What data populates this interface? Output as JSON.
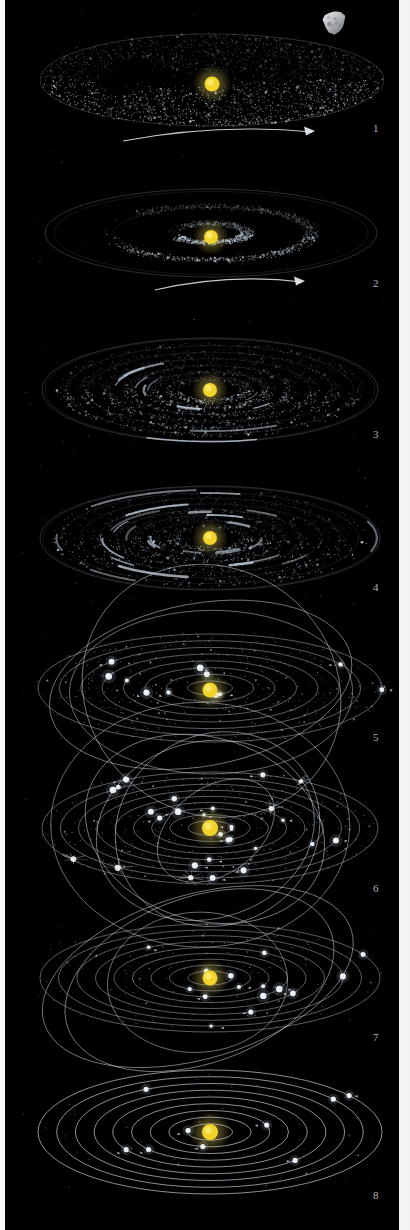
{
  "figure": {
    "background_color": "#000000",
    "border_color": "#f4f4f2",
    "star_color": "#f2d32a",
    "dust_color": "#c9d8e8",
    "orbit_color": "#cdd7e2",
    "width": 410,
    "height": 1230
  },
  "panels": [
    {
      "number": "1",
      "stage": "flattened-rotating-nebula",
      "caption": "Rotating cloud of gas and dust flattens into a disc",
      "top": 4,
      "height": 166,
      "sun_cx": 207,
      "sun_cy": 84,
      "sun_r": 7.5,
      "disc_rx": 172,
      "disc_ry": 46,
      "disc_cy": 80,
      "particle_count": 2600,
      "has_rotation_arrow": true,
      "arrow": {
        "x1": 118,
        "y1": 141,
        "x2": 307,
        "y2": 132,
        "label": "rotation-direction"
      },
      "has_asteroid": true,
      "asteroid": {
        "cx": 328,
        "cy": 22,
        "r": 13,
        "label": "asteroid-body"
      },
      "wedge_gap": true,
      "rings": 0
    },
    {
      "number": "2",
      "stage": "disc-breaking-into-bands",
      "caption": "Disc develops concentric turbulent bands",
      "top": 170,
      "height": 160,
      "sun_cx": 206,
      "sun_cy": 237,
      "sun_r": 7,
      "disc_rx": 166,
      "disc_ry": 44,
      "disc_cy": 233,
      "particle_count": 2300,
      "has_rotation_arrow": true,
      "arrow": {
        "x1": 150,
        "y1": 290,
        "x2": 297,
        "y2": 282,
        "label": "rotation-direction"
      },
      "has_asteroid": false,
      "wedge_gap": true,
      "rings": 2
    },
    {
      "number": "3",
      "stage": "condensation-into-rings",
      "caption": "Material condenses into distinct dust rings",
      "top": 334,
      "height": 150,
      "sun_cx": 205,
      "sun_cy": 390,
      "sun_r": 7,
      "disc_rx": 168,
      "disc_ry": 52,
      "disc_cy": 390,
      "particle_count": 2100,
      "has_rotation_arrow": false,
      "has_asteroid": false,
      "wedge_gap": false,
      "rings": 6
    },
    {
      "number": "4",
      "stage": "rings-clump-into-arcs",
      "caption": "Rings break up into clumps and arcs",
      "top": 470,
      "height": 142,
      "sun_cx": 205,
      "sun_cy": 538,
      "sun_r": 7,
      "disc_rx": 170,
      "disc_ry": 52,
      "disc_cy": 538,
      "particle_count": 1500,
      "has_rotation_arrow": false,
      "has_asteroid": false,
      "wedge_gap": false,
      "rings": 7
    },
    {
      "number": "5",
      "stage": "planetesimals-on-orbits",
      "caption": "Clumps accrete into planetesimals on defined orbits",
      "top": 608,
      "height": 142,
      "sun_cx": 205,
      "sun_cy": 690,
      "sun_r": 7.5,
      "disc_rx": 172,
      "disc_ry": 54,
      "disc_cy": 688,
      "particle_count": 520,
      "has_rotation_arrow": false,
      "has_asteroid": false,
      "wedge_gap": false,
      "orbits": 8,
      "inclined_orbits": 3,
      "bodies": 11
    },
    {
      "number": "6",
      "stage": "chaotic-crossing-orbits",
      "caption": "Planetesimals collide on steeply inclined crossing orbits",
      "top": 752,
      "height": 148,
      "sun_cx": 205,
      "sun_cy": 828,
      "sun_r": 8,
      "disc_rx": 168,
      "disc_ry": 56,
      "disc_cy": 828,
      "particle_count": 420,
      "has_rotation_arrow": false,
      "has_asteroid": false,
      "wedge_gap": false,
      "orbits": 9,
      "inclined_orbits": 5,
      "bodies": 22,
      "collision_flashes": 6
    },
    {
      "number": "7",
      "stage": "orbits-circularising",
      "caption": "Collisions damp out; orbits become more regular",
      "top": 902,
      "height": 148,
      "sun_cx": 205,
      "sun_cy": 978,
      "sun_r": 7.5,
      "disc_rx": 170,
      "disc_ry": 54,
      "disc_cy": 978,
      "particle_count": 180,
      "has_rotation_arrow": false,
      "has_asteroid": false,
      "wedge_gap": false,
      "orbits": 9,
      "inclined_orbits": 3,
      "bodies": 15
    },
    {
      "number": "8",
      "stage": "mature-planetary-system",
      "caption": "Stable solar system of planets on near-circular coplanar orbits",
      "top": 1052,
      "height": 160,
      "sun_cx": 205,
      "sun_cy": 1132,
      "sun_r": 8,
      "disc_rx": 172,
      "disc_ry": 62,
      "disc_cy": 1132,
      "particle_count": 40,
      "has_rotation_arrow": false,
      "has_asteroid": false,
      "wedge_gap": false,
      "orbits": 9,
      "inclined_orbits": 0,
      "bodies": 9
    }
  ],
  "labels": {
    "numbers": [
      "1",
      "2",
      "3",
      "4",
      "5",
      "6",
      "7",
      "8"
    ],
    "positions_y": [
      122,
      277,
      428,
      581,
      731,
      882,
      1031,
      1189
    ],
    "position_x": 368
  }
}
